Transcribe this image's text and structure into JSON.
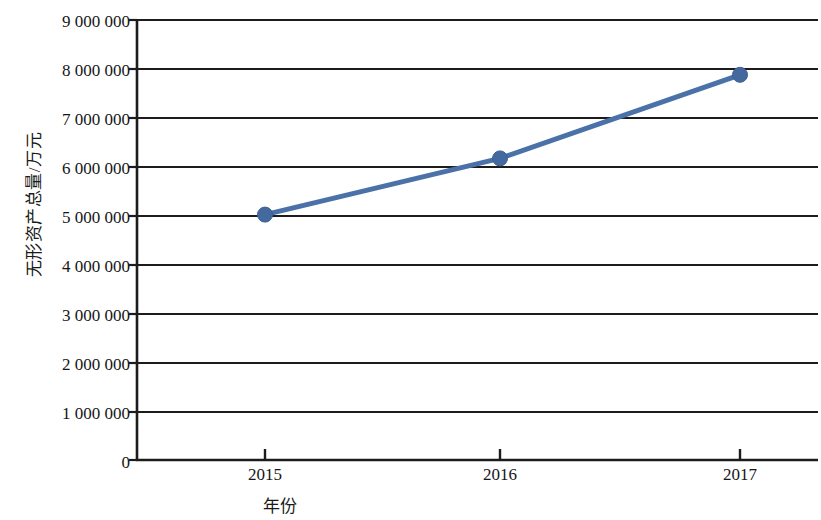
{
  "chart_data": {
    "type": "line",
    "title": "",
    "xlabel": "年份",
    "ylabel": "无形资产总量/万元",
    "categories": [
      "2015",
      "2016",
      "2017"
    ],
    "x": [
      2015,
      2016,
      2017
    ],
    "values": [
      5020000,
      6170000,
      7880000
    ],
    "series": [
      {
        "name": "无形资产总量",
        "values": [
          5020000,
          6170000,
          7880000
        ]
      }
    ],
    "ylim": [
      0,
      9000000
    ],
    "ytick_values": [
      0,
      1000000,
      2000000,
      3000000,
      4000000,
      5000000,
      6000000,
      7000000,
      8000000,
      9000000
    ],
    "ytick_labels": [
      "0",
      "1 000 000",
      "2 000 000",
      "3 000 000",
      "4 000 000",
      "5 000 000",
      "6 000 000",
      "7 000 000",
      "8 000 000",
      "9 000 000"
    ],
    "xtick_labels": [
      "2015",
      "2016",
      "2017"
    ],
    "grid": "horizontal",
    "legend": "none",
    "colors": {
      "line": "#4a72a8",
      "marker": "#44699e",
      "grid": "#1c1c1c",
      "axis": "#1c1c1c",
      "text": "#161616",
      "background": "#ffffff"
    },
    "marker": "circle",
    "line_width": 4
  }
}
